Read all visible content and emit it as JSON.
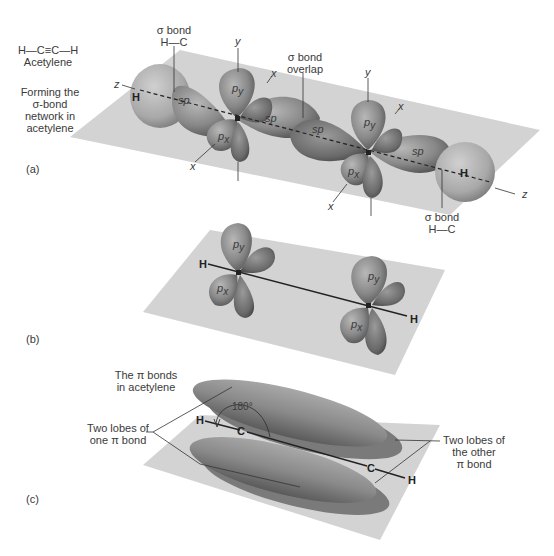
{
  "structure": {
    "formula": "H—C≡C—H",
    "name": "Acetylene"
  },
  "panel_a": {
    "label": "(a)",
    "caption_lines": [
      "Forming the",
      "σ-bond",
      "network in",
      "acetylene"
    ],
    "sigma_bond_left": [
      "σ bond",
      "H—C"
    ],
    "sigma_bond_overlap": [
      "σ bond",
      "overlap"
    ],
    "sigma_bond_right": [
      "σ bond",
      "H—C"
    ],
    "axes": {
      "y": "y",
      "x": "x",
      "z": "z"
    },
    "orbitals": {
      "sp": "sp",
      "py": "p",
      "py_sub": "y",
      "px": "p",
      "px_sub": "x"
    },
    "atoms": {
      "H": "H",
      "C": "C"
    }
  },
  "panel_b": {
    "label": "(b)",
    "atoms": {
      "H": "H",
      "C": "C"
    }
  },
  "panel_c": {
    "label": "(c)",
    "caption_lines": [
      "The π bonds",
      "in acetylene"
    ],
    "left_callout": [
      "Two lobes of",
      "one π bond"
    ],
    "right_callout": [
      "Two lobes of",
      "the other",
      "π bond"
    ],
    "angle": "180°",
    "atoms": {
      "H": "H",
      "C": "C"
    }
  },
  "colors": {
    "plane": "#d3d3d3",
    "lobe": "#8a8a8a",
    "lobe_dark": "#5e5e5e",
    "lobe_light": "#b5b5b5",
    "text": "#3a3a3a"
  }
}
